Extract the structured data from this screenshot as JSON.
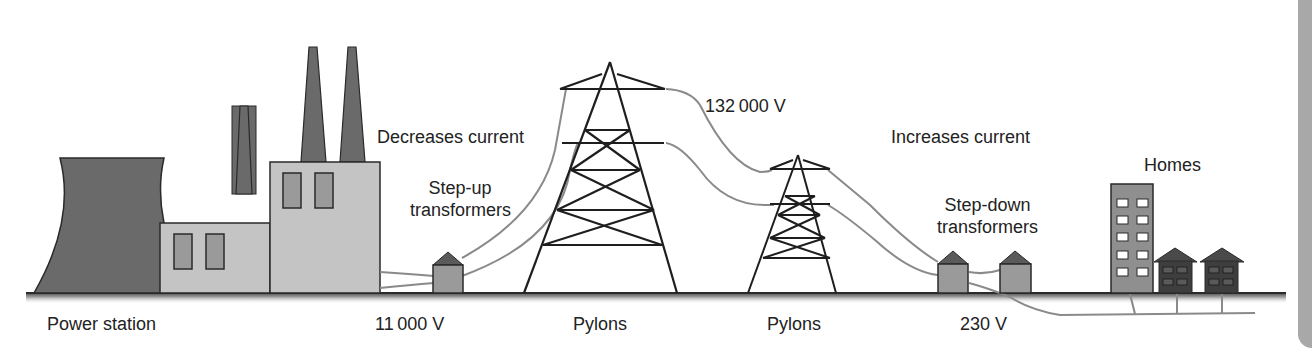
{
  "labels": {
    "power_station": "Power station",
    "decreases_current": "Decreases current",
    "step_up_line1": "Step-up",
    "step_up_line2": "transformers",
    "voltage_11000": "11 000 V",
    "pylons_1": "Pylons",
    "voltage_132000": "132 000 V",
    "pylons_2": "Pylons",
    "increases_current": "Increases current",
    "step_down_line1": "Step-down",
    "step_down_line2": "transformers",
    "voltage_230": "230 V",
    "homes": "Homes"
  },
  "stages": [
    {
      "name": "Power station",
      "voltage": "11 000 V"
    },
    {
      "name": "Step-up transformers",
      "effect": "Decreases current"
    },
    {
      "name": "Pylons",
      "voltage": "132 000 V"
    },
    {
      "name": "Pylons"
    },
    {
      "name": "Step-down transformers",
      "effect": "Increases current",
      "voltage": "230 V"
    },
    {
      "name": "Homes"
    }
  ],
  "colors": {
    "dark_gray": "#5f5f5f",
    "mid_gray": "#8f8f8f",
    "light_gray": "#c4c4c4",
    "cable": "#8a8a8a",
    "outline": "#2a2a2a",
    "frame": "#a8a8a8"
  }
}
